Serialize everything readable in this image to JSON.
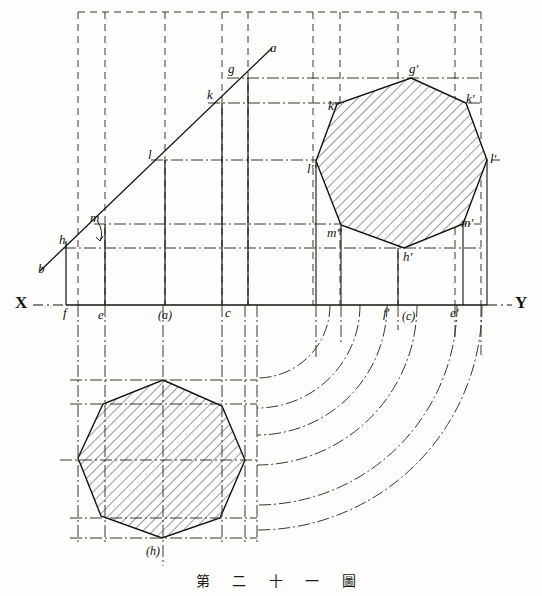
{
  "figure": {
    "caption": "第 二 十 一 圖",
    "caption_romanized": "Figure 21",
    "background_color": "#fdfdfb",
    "ink_color": "#14120f"
  },
  "axis": {
    "x_label": "X",
    "y_label": "Y",
    "ground_line_y": 305,
    "x_label_pos": [
      18,
      296
    ],
    "y_label_pos": [
      517,
      296
    ]
  },
  "inclined_line": {
    "start_label": "b",
    "end_label": "a",
    "a_pos": [
      269,
      44
    ],
    "b_pos": [
      40,
      268
    ],
    "angle_marker": "arc"
  },
  "line_points": [
    {
      "label": "a",
      "x": 272,
      "y": 46
    },
    {
      "label": "g",
      "x": 227,
      "y": 70
    },
    {
      "label": "k",
      "x": 208,
      "y": 95
    },
    {
      "label": "l",
      "x": 151,
      "y": 155
    },
    {
      "label": "m",
      "x": 94,
      "y": 218
    },
    {
      "label": "h",
      "x": 64,
      "y": 240
    },
    {
      "label": "b",
      "x": 43,
      "y": 268
    }
  ],
  "baseline_labels": [
    {
      "label": "f",
      "x": 66,
      "y": 308
    },
    {
      "label": "e",
      "x": 100,
      "y": 310
    },
    {
      "label": "(a)",
      "x": 160,
      "y": 310
    },
    {
      "label": "c",
      "x": 228,
      "y": 308
    },
    {
      "label": "f'",
      "x": 386,
      "y": 308
    },
    {
      "label": "(c)",
      "x": 404,
      "y": 312
    },
    {
      "label": "e'",
      "x": 452,
      "y": 308
    }
  ],
  "octagon_top_right": {
    "name": "front-view-octagon",
    "center": [
      398,
      170
    ],
    "vertices": [
      {
        "label": "g'",
        "x": 411,
        "y": 78
      },
      {
        "label": "k'",
        "x": 466,
        "y": 103
      },
      {
        "label": "l'",
        "x": 487,
        "y": 160
      },
      {
        "label": "m'",
        "x": 463,
        "y": 224
      },
      {
        "label": "h'",
        "x": 404,
        "y": 248
      },
      {
        "label": "m''",
        "x": 341,
        "y": 225
      },
      {
        "label": "l''",
        "x": 316,
        "y": 161
      },
      {
        "label": "k''",
        "x": 337,
        "y": 104
      }
    ],
    "hatched": true,
    "hatch_angle_deg": 45
  },
  "octagon_bottom_left": {
    "name": "plan-view-octagon",
    "label": "(h)",
    "label_pos": [
      148,
      549
    ],
    "center": [
      163,
      448
    ],
    "hatched": true,
    "hatch_angle_deg": 45
  },
  "projection_arcs": {
    "center": [
      257,
      305
    ],
    "count": 6,
    "style": "chain-dash",
    "radii": [
      73,
      103,
      130,
      160,
      200,
      225
    ]
  },
  "vertical_construction_lines": [
    78,
    105,
    165,
    222,
    248,
    313,
    340,
    398,
    455,
    481
  ],
  "horizontal_construction_lines": [
    78,
    103,
    160,
    224,
    248
  ],
  "line_styles": {
    "solid": "object line",
    "dashed": "hidden/construction line",
    "chain_dash": "centre / projector line"
  }
}
